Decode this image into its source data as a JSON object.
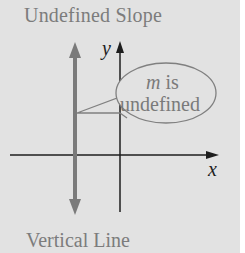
{
  "figure": {
    "title": "Undefined Slope",
    "caption": "Vertical Line",
    "x_axis_label": "x",
    "y_axis_label": "y",
    "callout": {
      "var": "m",
      "line1_rest": " is",
      "line2": "undefined"
    }
  },
  "colors": {
    "background": "#e2e2e2",
    "axis": "#1e1e1e",
    "vertical_line": "#7a7a7a",
    "callout_stroke": "#808080",
    "text_gray": "#7c7c7c"
  }
}
